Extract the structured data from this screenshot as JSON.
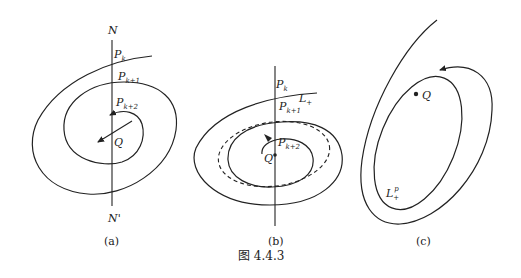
{
  "figure": {
    "caption": "图 4.4.3",
    "panels": [
      {
        "id": "a",
        "caption": "(a)",
        "labels": {
          "N": "N",
          "N_prime": "N'",
          "Pk": "P",
          "Pk_sub": "k",
          "Pk1": "P",
          "Pk1_sub": "k+1",
          "Pk2": "P",
          "Pk2_sub": "k+2",
          "Q": "Q"
        }
      },
      {
        "id": "b",
        "caption": "(b)",
        "labels": {
          "Pk": "P",
          "Pk_sub": "k",
          "L": "L",
          "L_sub": "+",
          "Pk1": "P",
          "Pk1_sub": "k+1",
          "Pk2": "P",
          "Pk2_sub": "k+2",
          "Q": "Q"
        }
      },
      {
        "id": "c",
        "caption": "(c)",
        "labels": {
          "Q": "Q",
          "L": "L",
          "L_sub": "+",
          "L_sup": "p"
        }
      }
    ]
  }
}
